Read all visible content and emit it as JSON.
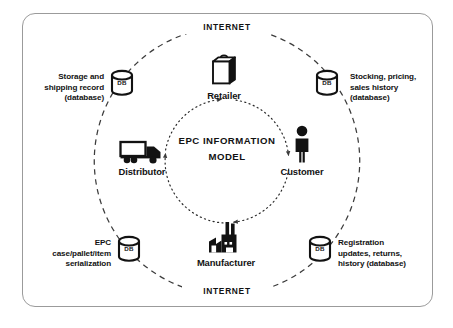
{
  "diagram": {
    "center_title_lines": [
      "EPC",
      "INFORMATION",
      "MODEL"
    ],
    "center_title": "EPC\nINFORMATION\nMODEL",
    "network_label_top": "INTERNET",
    "network_label_bottom": "INTERNET",
    "accent_color": "#121212",
    "frame_color": "#9b9b9b",
    "background_color": "#ffffff"
  },
  "entities": [
    {
      "id": "retailer",
      "label": "Retailer",
      "icon": "shopping-bag-icon",
      "position": "top"
    },
    {
      "id": "customer",
      "label": "Customer",
      "icon": "person-icon",
      "position": "right"
    },
    {
      "id": "manufacturer",
      "label": "Manufacturer",
      "icon": "factory-icon",
      "position": "bottom"
    },
    {
      "id": "distributor",
      "label": "Distributor",
      "icon": "truck-icon",
      "position": "left"
    }
  ],
  "databases": [
    {
      "id": "db-top-left",
      "icon_label": "DB",
      "icon": "database-cylinder-icon",
      "note": "Storage and\nshipping record\n(database)",
      "note_lines": [
        "Storage and",
        "shipping record",
        "(database)"
      ],
      "align": "left"
    },
    {
      "id": "db-top-right",
      "icon_label": "DB",
      "icon": "database-cylinder-icon",
      "note": "Stocking, pricing,\nsales history\n(database)",
      "note_lines": [
        "Stocking, pricing,",
        "sales history",
        "(database)"
      ],
      "align": "right"
    },
    {
      "id": "db-bottom-left",
      "icon_label": "DB",
      "icon": "database-cylinder-icon",
      "note": "EPC\ncase/pallet/item\nserialization",
      "note_lines": [
        "EPC",
        "case/pallet/item",
        "serialization"
      ],
      "align": "left"
    },
    {
      "id": "db-bottom-right",
      "icon_label": "DB",
      "icon": "database-cylinder-icon",
      "note": "Registration\nupdates, returns,\nhistory (database)",
      "note_lines": [
        "Registration",
        "updates, returns,",
        "history (database)"
      ],
      "align": "right"
    }
  ]
}
